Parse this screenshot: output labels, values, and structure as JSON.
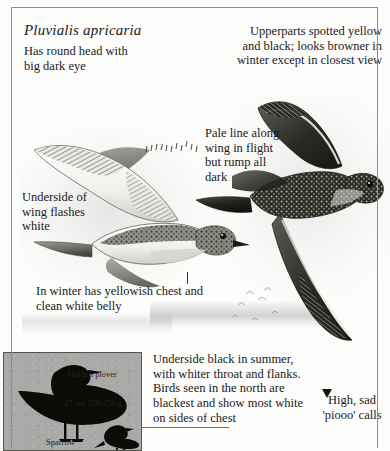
{
  "plate": {
    "species_title": "Pluvialis apricaria",
    "labels": {
      "head": "Has round head with big dark eye",
      "upperparts": "Upperparts spotted yellow and black; looks browner in winter except in closest view",
      "pale_line": "Pale line along wing in flight but rump all dark",
      "underwing": "Underside of wing flashes white",
      "winter": "In winter has yellowish chest and clean white belly",
      "underside_black": "Underside black in summer, with whiter throat and flanks. Birds seen in the north are blackest and show most white on sides of chest",
      "calls": "High, sad 'piooo' calls"
    },
    "icons": {
      "underwing_leader": "tick-leader-marks",
      "call_marker": "arrowhead-marker"
    }
  },
  "size_inset": {
    "main_bird_label": "Golden plover",
    "measurements": "27 cm  150-250 g",
    "compare_bird_label": "Sparrow",
    "silhouettes": [
      "golden-plover-silhouette",
      "sparrow-silhouette"
    ],
    "background_color": "#a9a9a8"
  },
  "colors": {
    "paper": "#fdfdfc",
    "ink": "#1a1a1a",
    "frame": "#8e8e8e",
    "inset_bg": "#a9a9a8",
    "inset_border": "#55554f"
  }
}
